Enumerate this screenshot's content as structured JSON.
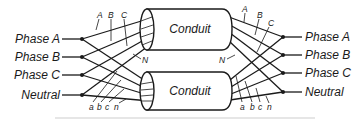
{
  "diagram": {
    "type": "parallel-conduit-wiring",
    "conduits": [
      {
        "id": "top",
        "label": "Conduit"
      },
      {
        "id": "bottom",
        "label": "Conduit"
      }
    ],
    "left_terminals": [
      {
        "label": "Phase A"
      },
      {
        "label": "Phase B"
      },
      {
        "label": "Phase C"
      },
      {
        "label": "Neutral"
      }
    ],
    "right_terminals": [
      {
        "label": "Phase A"
      },
      {
        "label": "Phase B"
      },
      {
        "label": "Phase C"
      },
      {
        "label": "Neutral"
      }
    ],
    "top_conduit_wire_labels": [
      "A",
      "B",
      "C",
      "N"
    ],
    "bottom_conduit_wire_labels": [
      "a",
      "b",
      "c",
      "n"
    ],
    "colors": {
      "line": "#1a1a1a",
      "background": "#ffffff"
    }
  }
}
